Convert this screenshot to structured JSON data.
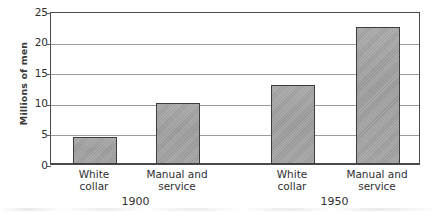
{
  "chart_data": {
    "type": "bar",
    "title": "",
    "xlabel": "",
    "ylabel": "Millions of men",
    "ylim": [
      0,
      25
    ],
    "yticks": [
      0,
      5,
      10,
      15,
      20,
      25
    ],
    "ytick_labels": [
      "0",
      "5",
      "10",
      "15",
      "20",
      "25"
    ],
    "grid": true,
    "legend": "none",
    "groups": [
      "1900",
      "1950"
    ],
    "categories": [
      "White\ncollar",
      "Manual and\nservice"
    ],
    "bars": [
      {
        "group": "1900",
        "category": "White\ncollar",
        "label_line1": "White",
        "label_line2": "collar",
        "value": 4.4
      },
      {
        "group": "1900",
        "category": "Manual and\nservice",
        "label_line1": "Manual and",
        "label_line2": "service",
        "value": 10.0
      },
      {
        "group": "1950",
        "category": "White\ncollar",
        "label_line1": "White",
        "label_line2": "collar",
        "value": 12.9
      },
      {
        "group": "1950",
        "category": "Manual and\nservice",
        "label_line1": "Manual and",
        "label_line2": "service",
        "value": 22.4
      }
    ],
    "series": [
      {
        "name": "1900",
        "values": [
          4.4,
          10.0
        ]
      },
      {
        "name": "1950",
        "values": [
          12.9,
          22.4
        ]
      }
    ],
    "colors": {
      "bar_fill": "#a0a0a0",
      "bar_border": "#3d3d3d",
      "gridline": "#9a9a9a",
      "axis": "#4a4a4a",
      "text": "#2f2f2f",
      "background": "#ffffff"
    }
  }
}
